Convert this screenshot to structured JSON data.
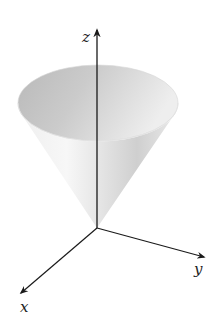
{
  "figure": {
    "axes": {
      "z": {
        "label": "z"
      },
      "y": {
        "label": "y"
      },
      "x": {
        "label": "x"
      }
    },
    "colors": {
      "axis": "#1a1a1a",
      "cone_light": "#f4f4f4",
      "cone_mid": "#d9d9d9",
      "cone_dark": "#bdbdbd",
      "interior": "#c8c8c8"
    }
  }
}
